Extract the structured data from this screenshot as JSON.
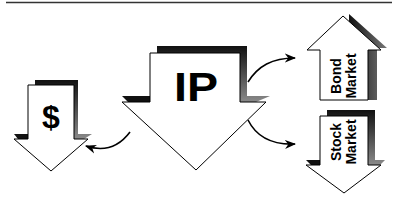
{
  "diagram": {
    "center_node": {
      "label": "IP",
      "direction": "down"
    },
    "left_node": {
      "label": "$",
      "direction": "down"
    },
    "top_right_node": {
      "label_line1": "Bond",
      "label_line2": "Market",
      "direction": "up"
    },
    "bottom_right_node": {
      "label_line1": "Stock",
      "label_line2": "Market",
      "direction": "down"
    },
    "connectors": [
      {
        "from": "IP",
        "to": "$"
      },
      {
        "from": "IP",
        "to": "Bond Market"
      },
      {
        "from": "IP",
        "to": "Stock Market"
      }
    ]
  },
  "colors": {
    "stroke": "#000000",
    "fill": "#ffffff",
    "shadow_dark": "#111111",
    "shadow_light": "#9a9a9a"
  }
}
